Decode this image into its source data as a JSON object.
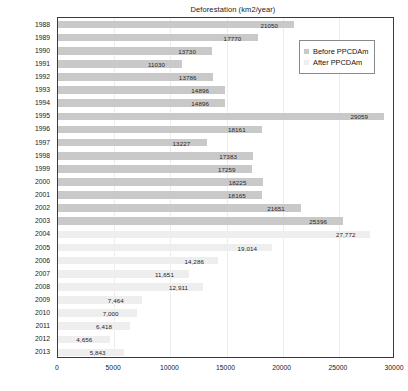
{
  "chart_data": {
    "type": "bar",
    "orientation": "horizontal",
    "title": "Deforestation (km2/year)",
    "xlabel": "",
    "ylabel": "",
    "xlim": [
      0,
      30000
    ],
    "xticks": [
      "0",
      "5000",
      "10000",
      "15000",
      "20000",
      "25000",
      "30000"
    ],
    "xtick_values": [
      0,
      5000,
      10000,
      15000,
      20000,
      25000,
      30000
    ],
    "grid": true,
    "legend_position": "top-right",
    "legend": [
      "Before PPCDAm",
      "After PPCDAm"
    ],
    "categories": [
      "1988",
      "1989",
      "1990",
      "1991",
      "1992",
      "1993",
      "1994",
      "1995",
      "1996",
      "1997",
      "1998",
      "1999",
      "2000",
      "2001",
      "2002",
      "2003",
      "2004",
      "2005",
      "2006",
      "2007",
      "2008",
      "2009",
      "2010",
      "2011",
      "2012",
      "2013"
    ],
    "values": [
      21050,
      17770,
      13730,
      11030,
      13786,
      14896,
      14896,
      29059,
      18161,
      13227,
      17383,
      17259,
      18225,
      18165,
      21651,
      25396,
      27772,
      19014,
      14286,
      11651,
      12911,
      7464,
      7000,
      6418,
      4656,
      5843
    ],
    "value_labels": [
      "21050",
      "17770",
      "13730",
      "11030",
      "13786",
      "14896",
      "14896",
      "29059",
      "18161",
      "13227",
      "17383",
      "17259",
      "18225",
      "18165",
      "21651",
      "25396",
      "27,772",
      "19,014",
      "14,286",
      "11,651",
      "12,911",
      "7,464",
      "7,000",
      "6,418",
      "4,656",
      "5,843"
    ],
    "series_assignment": [
      "before",
      "before",
      "before",
      "before",
      "before",
      "before",
      "before",
      "before",
      "before",
      "before",
      "before",
      "before",
      "before",
      "before",
      "before",
      "before",
      "after",
      "after",
      "after",
      "after",
      "after",
      "after",
      "after",
      "after",
      "after",
      "after"
    ],
    "colors": {
      "before": "#c9c9c9",
      "after": "#eeeeee",
      "axis": "#3a3a3a",
      "grid": "#ededed",
      "text": "#1a1a1a"
    }
  },
  "legend": {
    "items": [
      {
        "label": "Before PPCDAm",
        "key": "before"
      },
      {
        "label": "After PPCDAm",
        "key": "after"
      }
    ]
  }
}
